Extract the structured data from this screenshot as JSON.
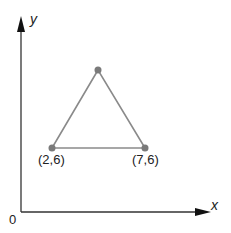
{
  "diagram": {
    "axes": {
      "x_label": "x",
      "y_label": "y",
      "origin_label": "0"
    },
    "triangle": {
      "vertices": [
        {
          "label": "(2,6)",
          "x": 2,
          "y": 6
        },
        {
          "label": "(7,6)",
          "x": 7,
          "y": 6
        },
        {
          "label": "",
          "x": 4.5,
          "y": null
        }
      ]
    },
    "colors": {
      "axis": "#222222",
      "triangle_edge": "#888888",
      "vertex": "#7a7a7a"
    }
  }
}
